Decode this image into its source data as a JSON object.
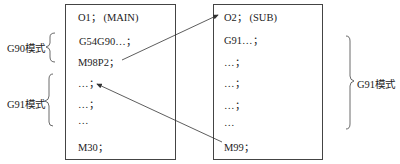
{
  "main_program": {
    "lines": [
      "O1；  (MAIN)",
      "G54G90…；",
      "M98P2；",
      "…；",
      "…；",
      "…",
      "M30；"
    ]
  },
  "sub_program": {
    "lines": [
      "O2；  (SUB)",
      "G91…；",
      "…；",
      "…；",
      "…；",
      "…",
      "M99；"
    ]
  },
  "labels": {
    "g90_mode": "G90模式",
    "g91_mode_left": "G91模式",
    "g91_mode_right": "G91模式"
  }
}
